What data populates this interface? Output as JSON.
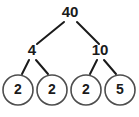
{
  "diagram": {
    "title": "40",
    "type": "factor-tree",
    "colors": {
      "background": "#ffffff",
      "text": "#1a1a1a",
      "edge": "#1a1a1a",
      "circle_stroke": "#4d4d4d"
    },
    "nodes": {
      "root": {
        "label": "40",
        "x": 70,
        "y": 13
      },
      "left_branch": {
        "label": "4",
        "x": 32,
        "y": 51
      },
      "right_branch": {
        "label": "10",
        "x": 100,
        "y": 51
      },
      "leaves": [
        {
          "label": "2",
          "cx": 18,
          "cy": 90,
          "r": 15
        },
        {
          "label": "2",
          "cx": 52,
          "cy": 90,
          "r": 15
        },
        {
          "label": "2",
          "cx": 86,
          "cy": 90,
          "r": 15
        },
        {
          "label": "5",
          "cx": 120,
          "cy": 90,
          "r": 15
        }
      ]
    },
    "edges": [
      {
        "name": "root-to-left",
        "x1": 64,
        "y1": 22,
        "x2": 37,
        "y2": 44
      },
      {
        "name": "root-to-right",
        "x1": 77,
        "y1": 22,
        "x2": 99,
        "y2": 44
      },
      {
        "name": "left-to-leaf1",
        "x1": 29,
        "y1": 60,
        "x2": 22,
        "y2": 74
      },
      {
        "name": "left-to-leaf2",
        "x1": 36,
        "y1": 60,
        "x2": 48,
        "y2": 74
      },
      {
        "name": "right-to-leaf3",
        "x1": 97,
        "y1": 60,
        "x2": 90,
        "y2": 74
      },
      {
        "name": "right-to-leaf4",
        "x1": 104,
        "y1": 60,
        "x2": 116,
        "y2": 74
      }
    ]
  }
}
